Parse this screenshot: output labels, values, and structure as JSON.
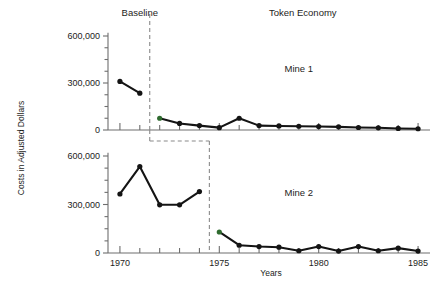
{
  "chart_data": {
    "type": "line",
    "title": "",
    "xlabel": "Years",
    "ylabel": "Costs in Adjusted Dollars",
    "xlim": [
      1969.4,
      1985.6
    ],
    "ylim": [
      0,
      680000
    ],
    "yticks": [
      0,
      300000,
      600000
    ],
    "ytick_labels": [
      "0",
      "300,000",
      "600,000"
    ],
    "yminor_step": 75000,
    "xticks": [
      1970,
      1971,
      1972,
      1973,
      1974,
      1975,
      1976,
      1977,
      1978,
      1979,
      1980,
      1981,
      1982,
      1983,
      1984,
      1985
    ],
    "xtick_labels_shown": [
      "1970",
      "1975",
      "1980",
      "1985"
    ],
    "grid": false,
    "legend": false,
    "phase_labels": [
      {
        "text": "Baseline",
        "x": 1971.0
      },
      {
        "text": "Token Economy",
        "x": 1979.2
      }
    ],
    "panels": [
      {
        "name": "Mine 1",
        "panel_label": "Mine 1",
        "phase_change_x": 1971.5,
        "series": [
          {
            "name": "Mine 1 Baseline",
            "phase": "baseline",
            "x": [
              1970,
              1971
            ],
            "values": [
              310000,
              235000
            ]
          },
          {
            "name": "Mine 1 Token Economy",
            "phase": "token-economy",
            "x": [
              1972,
              1973,
              1974,
              1975,
              1976,
              1977,
              1978,
              1979,
              1980,
              1981,
              1982,
              1983,
              1984,
              1985
            ],
            "values": [
              75000,
              42000,
              28000,
              15000,
              75000,
              28000,
              26000,
              24000,
              22000,
              20000,
              16000,
              14000,
              10000,
              8000
            ]
          }
        ]
      },
      {
        "name": "Mine 2",
        "panel_label": "Mine 2",
        "phase_change_x": 1974.5,
        "series": [
          {
            "name": "Mine 2 Baseline",
            "phase": "baseline",
            "x": [
              1970,
              1971,
              1972,
              1973,
              1974
            ],
            "values": [
              365000,
              535000,
              298000,
              298000,
              380000
            ]
          },
          {
            "name": "Mine 2 Token Economy",
            "phase": "token-economy",
            "x": [
              1975,
              1976,
              1977,
              1978,
              1979,
              1980,
              1981,
              1982,
              1983,
              1984,
              1985
            ],
            "values": [
              130000,
              48000,
              40000,
              36000,
              14000,
              40000,
              12000,
              40000,
              14000,
              30000,
              12000
            ]
          }
        ]
      }
    ],
    "first_intervention_point_color": "#2f6b2f",
    "line_color": "#141414",
    "axis_color": "#6e6e6e",
    "phase_line_color": "#8a8a8a"
  }
}
